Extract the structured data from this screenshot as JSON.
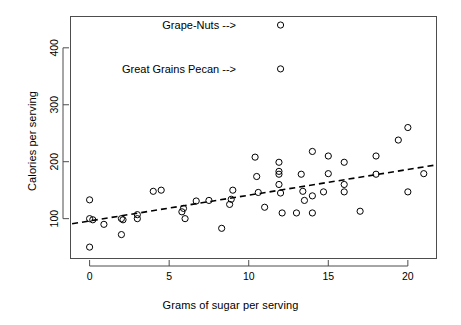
{
  "chart_data": {
    "type": "scatter",
    "title": "",
    "xlabel": "Grams of sugar per serving",
    "ylabel": "Calories per serving",
    "xlim": [
      -1.2,
      21.8
    ],
    "ylim": [
      30,
      455
    ],
    "xticks": [
      0,
      5,
      10,
      15,
      20
    ],
    "xticklabels": [
      "0",
      "5",
      "10",
      "15",
      "20"
    ],
    "yticks": [
      100,
      200,
      300,
      400
    ],
    "yticklabels": [
      "100",
      "200",
      "300",
      "400"
    ],
    "grid": false,
    "legend": false,
    "marker": "open-circle",
    "marker_color": "#000000",
    "points": [
      {
        "x": 0.0,
        "y": 50
      },
      {
        "x": 0.0,
        "y": 100
      },
      {
        "x": 0.0,
        "y": 133
      },
      {
        "x": 0.2,
        "y": 98
      },
      {
        "x": 0.9,
        "y": 90
      },
      {
        "x": 2.0,
        "y": 72
      },
      {
        "x": 2.0,
        "y": 100
      },
      {
        "x": 2.1,
        "y": 98
      },
      {
        "x": 3.0,
        "y": 100
      },
      {
        "x": 3.0,
        "y": 107
      },
      {
        "x": 4.0,
        "y": 148
      },
      {
        "x": 4.5,
        "y": 150
      },
      {
        "x": 5.8,
        "y": 112
      },
      {
        "x": 5.9,
        "y": 118
      },
      {
        "x": 6.0,
        "y": 100
      },
      {
        "x": 6.7,
        "y": 131
      },
      {
        "x": 7.5,
        "y": 132
      },
      {
        "x": 8.3,
        "y": 83
      },
      {
        "x": 8.8,
        "y": 125
      },
      {
        "x": 8.9,
        "y": 134
      },
      {
        "x": 9.0,
        "y": 150
      },
      {
        "x": 10.4,
        "y": 208
      },
      {
        "x": 10.5,
        "y": 174
      },
      {
        "x": 10.6,
        "y": 146
      },
      {
        "x": 11.0,
        "y": 120
      },
      {
        "x": 12.0,
        "y": 440
      },
      {
        "x": 12.0,
        "y": 363
      },
      {
        "x": 11.9,
        "y": 199
      },
      {
        "x": 11.9,
        "y": 183
      },
      {
        "x": 11.9,
        "y": 178
      },
      {
        "x": 11.9,
        "y": 160
      },
      {
        "x": 12.0,
        "y": 145
      },
      {
        "x": 12.1,
        "y": 110
      },
      {
        "x": 13.0,
        "y": 110
      },
      {
        "x": 13.3,
        "y": 178
      },
      {
        "x": 13.4,
        "y": 148
      },
      {
        "x": 13.5,
        "y": 132
      },
      {
        "x": 14.0,
        "y": 218
      },
      {
        "x": 14.0,
        "y": 140
      },
      {
        "x": 14.0,
        "y": 110
      },
      {
        "x": 14.7,
        "y": 147
      },
      {
        "x": 15.0,
        "y": 210
      },
      {
        "x": 15.0,
        "y": 179
      },
      {
        "x": 16.0,
        "y": 199
      },
      {
        "x": 16.0,
        "y": 160
      },
      {
        "x": 16.0,
        "y": 147
      },
      {
        "x": 17.0,
        "y": 113
      },
      {
        "x": 18.0,
        "y": 210
      },
      {
        "x": 18.0,
        "y": 178
      },
      {
        "x": 19.4,
        "y": 238
      },
      {
        "x": 20.0,
        "y": 260
      },
      {
        "x": 20.0,
        "y": 147
      },
      {
        "x": 21.0,
        "y": 179
      }
    ],
    "trendline": {
      "style": "dashed",
      "color": "#000000",
      "x0": -1.1,
      "y0": 91,
      "x1": 21.7,
      "y1": 194
    },
    "annotations": [
      {
        "text": "Grape-Nuts -->",
        "x": 9.2,
        "y": 440,
        "align": "right"
      },
      {
        "text": "Great Grains Pecan -->",
        "x": 9.2,
        "y": 363,
        "align": "right"
      }
    ]
  }
}
